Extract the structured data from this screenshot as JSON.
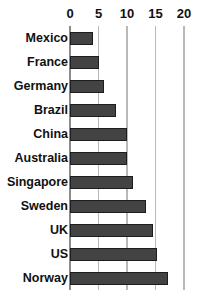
{
  "chart_data": {
    "type": "bar",
    "orientation": "horizontal",
    "title": "",
    "xlabel": "",
    "ylabel": "",
    "categories": [
      "Mexico",
      "France",
      "Germany",
      "Brazil",
      "China",
      "Australia",
      "Singapore",
      "Sweden",
      "UK",
      "US",
      "Norway"
    ],
    "values": [
      4,
      5,
      6,
      8,
      10,
      10,
      11,
      13.3,
      14.5,
      15.3,
      17.2
    ],
    "xlim": [
      0,
      20
    ],
    "xticks": [
      0,
      5,
      10,
      15,
      20
    ],
    "xtick_labels": [
      "0",
      "5",
      "10",
      "15",
      "20"
    ],
    "grid": true,
    "grid_axis": "x",
    "legend": false,
    "bar_color": "#434343",
    "bar_edge_color": "#1d1d1d",
    "grid_color": "#b9b9b9",
    "axis_color": "#8d8d8d",
    "text_color": "#111111",
    "background": "#ffffff",
    "axis_position": "top"
  }
}
